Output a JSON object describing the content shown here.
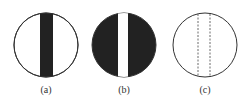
{
  "figure": {
    "panels": [
      {
        "id": "a",
        "label": "(a)",
        "description": "white circle with black vertical bar"
      },
      {
        "id": "b",
        "label": "(b)",
        "description": "black circle with white vertical bar"
      },
      {
        "id": "c",
        "label": "(c)",
        "description": "white circle with two dashed vertical lines"
      }
    ],
    "colors": {
      "stroke": "#333333",
      "fill_dark": "#222222",
      "fill_light": "#ffffff"
    }
  }
}
